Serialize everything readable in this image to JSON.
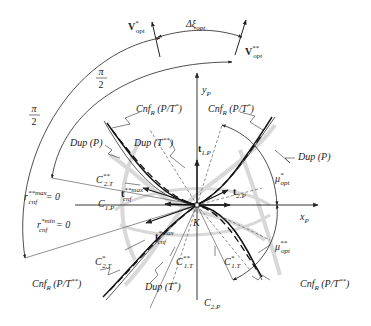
{
  "diagram": {
    "type": "geometric-kinematic-diagram",
    "origin_label": "K",
    "axes": {
      "x": {
        "label": "x",
        "subscript": "P"
      },
      "y": {
        "label": "y",
        "subscript": "P"
      }
    },
    "vectors": {
      "v_opt_star": {
        "label": "V",
        "superscript": "*",
        "subscript": "opt"
      },
      "v_opt_double_star": {
        "label": "V",
        "superscript": "**",
        "subscript": "opt"
      },
      "t1p": {
        "label": "t",
        "subscript": "1.P"
      },
      "t2p": {
        "label": "t",
        "subscript": "2.P"
      },
      "t_cnf_double_star_max": {
        "label": "t",
        "superscript": "**max",
        "subscript": "cnf"
      },
      "t_cnf_star_max": {
        "label": "t",
        "superscript": "*max",
        "subscript": "cnf"
      }
    },
    "angles": {
      "delta_xi": {
        "label": "Δξ",
        "subscript": "opt"
      },
      "pi_half_outer": {
        "numerator": "π",
        "denominator": "2"
      },
      "pi_half_inner": {
        "numerator": "π",
        "denominator": "2"
      },
      "mu_opt_star": {
        "label": "μ",
        "superscript": "*",
        "subscript": "opt"
      },
      "mu_opt_double_star": {
        "label": "μ",
        "superscript": "**",
        "subscript": "opt"
      }
    },
    "curve_labels": {
      "cnf_top_left": {
        "text": "Cnf",
        "subscript": "R",
        "rest": " (P/T",
        "superscript": "*",
        "close": ")"
      },
      "cnf_top_right": {
        "text": "Cnf",
        "subscript": "R",
        "rest": " (P/T",
        "superscript": "*",
        "close": ")"
      },
      "cnf_bottom_left": {
        "text": "Cnf",
        "subscript": "R",
        "rest": " (P/T",
        "superscript": "**",
        "close": ")"
      },
      "cnf_bottom_right": {
        "text": "Cnf",
        "subscript": "R",
        "rest": " (P/T",
        "superscript": "**",
        "close": ")"
      },
      "dup_p_left": {
        "text": "Dup (P)"
      },
      "dup_p_right": {
        "text": "Dup (P)"
      },
      "dup_t_double_star": {
        "text": "Dup (T",
        "superscript": "**",
        "close": ")"
      },
      "dup_t_star": {
        "text": "Dup (T",
        "superscript": "*",
        "close": ")"
      }
    },
    "line_labels": {
      "c2t_double_star": {
        "label": "C",
        "superscript": "**",
        "subscript": "2.T"
      },
      "c1p": {
        "label": "C",
        "subscript": "1.P"
      },
      "c2t_star": {
        "label": "C",
        "superscript": "*",
        "subscript": "2.T"
      },
      "c1t_double_star": {
        "label": "C",
        "superscript": "**",
        "subscript": "1.T"
      },
      "c1t_star": {
        "label": "C",
        "superscript": "*",
        "subscript": "1.T"
      },
      "c2p": {
        "label": "C",
        "subscript": "2.P"
      },
      "r_cnf_max": {
        "label": "r",
        "superscript": "**max",
        "subscript": "cnf",
        "rest": " = 0"
      },
      "r_cnf_min": {
        "label": "r",
        "superscript": "*min",
        "subscript": "cnf",
        "rest": " = 0"
      }
    },
    "colors": {
      "ink": "#222222",
      "gray_curves": "#c8c8c8",
      "thin_lines": "#555555"
    }
  }
}
